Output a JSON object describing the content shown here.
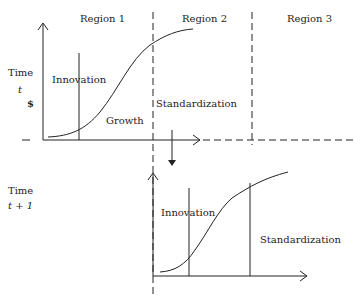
{
  "diagram": {
    "regions": [
      "Region 1",
      "Region 2",
      "Region 3"
    ],
    "top_panel": {
      "time_label": "Time",
      "time_var": "t",
      "y_unit": "$",
      "phases": [
        "Innovation",
        "Growth",
        "Standardization"
      ]
    },
    "bottom_panel": {
      "time_label": "Time",
      "time_var": "t + 1",
      "phases": [
        "Innovation",
        "Standardization"
      ]
    }
  }
}
